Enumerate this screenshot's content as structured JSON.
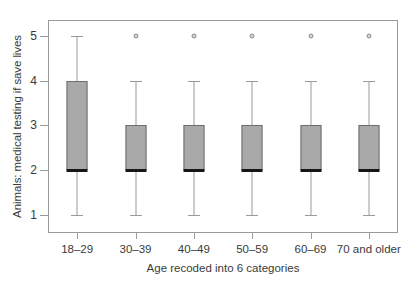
{
  "chart_data": {
    "type": "box",
    "title": "",
    "xlabel": "Age recoded into 6 categories",
    "ylabel": "Animals: medical testing if save lives",
    "categories": [
      "18–29",
      "30–39",
      "40–49",
      "50–59",
      "60–69",
      "70 and older"
    ],
    "ylim": [
      0.6,
      5.35
    ],
    "yticks": [
      1,
      2,
      3,
      4,
      5
    ],
    "ytick_labels": [
      "1",
      "2",
      "3",
      "4",
      "5"
    ],
    "grid": false,
    "legend": null,
    "boxes": [
      {
        "category": "18–29",
        "whisker_low": 1,
        "q1": 2,
        "median": 2,
        "q3": 4,
        "whisker_high": 5,
        "outliers": []
      },
      {
        "category": "30–39",
        "whisker_low": 1,
        "q1": 2,
        "median": 2,
        "q3": 3,
        "whisker_high": 4,
        "outliers": [
          5
        ]
      },
      {
        "category": "40–49",
        "whisker_low": 1,
        "q1": 2,
        "median": 2,
        "q3": 3,
        "whisker_high": 4,
        "outliers": [
          5
        ]
      },
      {
        "category": "50–59",
        "whisker_low": 1,
        "q1": 2,
        "median": 2,
        "q3": 3,
        "whisker_high": 4,
        "outliers": [
          5
        ]
      },
      {
        "category": "60–69",
        "whisker_low": 1,
        "q1": 2,
        "median": 2,
        "q3": 3,
        "whisker_high": 4,
        "outliers": [
          5
        ]
      },
      {
        "category": "70 and older",
        "whisker_low": 1,
        "q1": 2,
        "median": 2,
        "q3": 3,
        "whisker_high": 4,
        "outliers": [
          5
        ]
      }
    ],
    "colors": {
      "box_fill": "#a9a9a9",
      "box_edge": "#6d6d6d",
      "median": "#161616",
      "whisker": "#9a9a9a",
      "outlier_fill": "#d6d6d6",
      "outlier_edge": "#8a8a8a",
      "frame": "#9b9b9b",
      "text": "#3a3a3a",
      "background": "#ffffff"
    }
  }
}
